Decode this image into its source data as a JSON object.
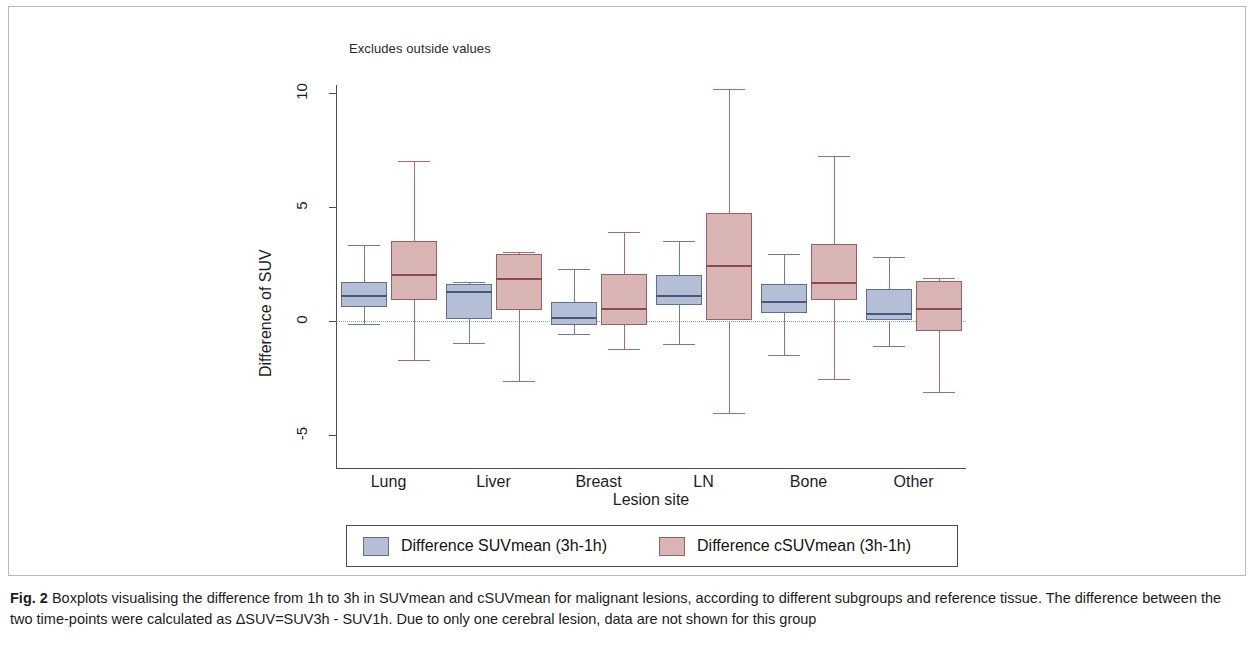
{
  "figure": {
    "note": "Excludes outside values",
    "caption_bold": "Fig. 2",
    "caption_text": " Boxplots visualising the difference from 1h to 3h in SUVmean and cSUVmean for malignant lesions, according to different subgroups and reference tissue. The difference between the two time-points were calculated as ΔSUV=SUV3h - SUV1h. Due to only one cerebral lesion, data are not shown for this group"
  },
  "colors": {
    "blue_fill": "#b4bed4",
    "blue_line": "#5e6f95",
    "red_fill": "#d8b4b4",
    "red_line": "#9a5f60",
    "zero_line": "#8c9ec4",
    "axis": "#4d4d4d"
  },
  "legend": {
    "position": "bottom",
    "entries": [
      {
        "label": "Difference SUVmean (3h-1h)",
        "color": "#b4bed4",
        "swatch": "blue-sw"
      },
      {
        "label": "Difference cSUVmean (3h-1h)",
        "color": "#d8b4b4",
        "swatch": "red-sw"
      }
    ]
  },
  "chart_data": {
    "type": "box",
    "title": "",
    "subtitle": "Excludes outside values",
    "xlabel": "Lesion site",
    "ylabel": "Difference of SUV",
    "ylim": [
      -6.8,
      11.0
    ],
    "yticks": [
      -5,
      0,
      5,
      10
    ],
    "ytick_labels": [
      "-5",
      "0",
      "5",
      "10"
    ],
    "grid": false,
    "reference_line": 0,
    "categories": [
      "Lung",
      "Liver",
      "Breast",
      "LN",
      "Bone",
      "Other"
    ],
    "series": [
      {
        "name": "Difference SUVmean (3h-1h)",
        "color": "#b4bed4",
        "boxes": [
          {
            "category": "Lung",
            "whisker_low": -0.15,
            "q1": 0.6,
            "median": 1.1,
            "q3": 1.7,
            "whisker_high": 3.3
          },
          {
            "category": "Liver",
            "whisker_low": -1.0,
            "q1": 0.05,
            "median": 1.3,
            "q3": 1.6,
            "whisker_high": 1.7
          },
          {
            "category": "Breast",
            "whisker_low": -0.6,
            "q1": -0.2,
            "median": 0.15,
            "q3": 0.8,
            "whisker_high": 2.25
          },
          {
            "category": "LN",
            "whisker_low": -1.05,
            "q1": 0.7,
            "median": 1.1,
            "q3": 2.0,
            "whisker_high": 3.5
          },
          {
            "category": "Bone",
            "whisker_low": -1.5,
            "q1": 0.35,
            "median": 0.85,
            "q3": 1.6,
            "whisker_high": 2.9
          },
          {
            "category": "Other",
            "whisker_low": -1.1,
            "q1": 0.0,
            "median": 0.35,
            "q3": 1.4,
            "whisker_high": 2.8
          }
        ]
      },
      {
        "name": "Difference cSUVmean (3h-1h)",
        "color": "#d8b4b4",
        "boxes": [
          {
            "category": "Lung",
            "whisker_low": -1.75,
            "q1": 0.9,
            "median": 2.05,
            "q3": 3.5,
            "whisker_high": 7.0
          },
          {
            "category": "Liver",
            "whisker_low": -2.65,
            "q1": 0.45,
            "median": 1.85,
            "q3": 2.9,
            "whisker_high": 3.0
          },
          {
            "category": "Breast",
            "whisker_low": -1.25,
            "q1": -0.2,
            "median": 0.55,
            "q3": 2.05,
            "whisker_high": 3.9
          },
          {
            "category": "LN",
            "whisker_low": -4.05,
            "q1": 0.0,
            "median": 2.45,
            "q3": 4.7,
            "whisker_high": 10.15
          },
          {
            "category": "Bone",
            "whisker_low": -2.55,
            "q1": 0.9,
            "median": 1.7,
            "q3": 3.35,
            "whisker_high": 7.2
          },
          {
            "category": "Other",
            "whisker_low": -3.15,
            "q1": -0.45,
            "median": 0.55,
            "q3": 1.75,
            "whisker_high": 1.85
          }
        ]
      }
    ]
  }
}
